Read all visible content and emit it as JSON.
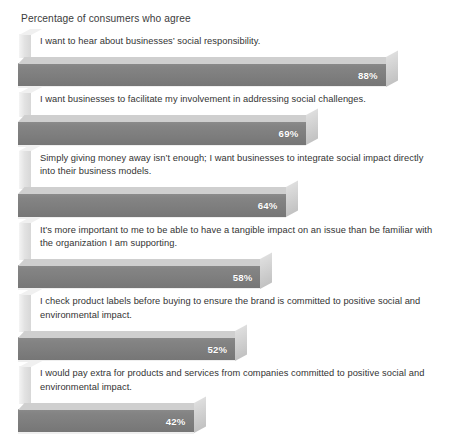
{
  "chart": {
    "title": "Percentage of consumers who agree"
  },
  "chart_data": {
    "type": "bar",
    "orientation": "horizontal",
    "title": "Percentage of consumers who agree",
    "xlabel": "",
    "ylabel": "",
    "xlim": [
      0,
      100
    ],
    "grid": false,
    "legend": null,
    "value_suffix": "%",
    "categories": [
      "I want to hear about businesses’ social responsibility.",
      "I want businesses to facilitate my involvement in addressing social challenges.",
      "Simply giving money away isn’t enough; I want businesses to integrate social impact directly into their business models.",
      "It’s more important to me to be able to have a tangible impact on an issue than be familiar with the organization I am supporting.",
      "I check product labels before buying to ensure the brand is committed to positive social and environmental impact.",
      "I would pay extra for products and services from companies committed to positive social and environmental impact."
    ],
    "values": [
      88,
      69,
      64,
      58,
      52,
      42
    ],
    "value_labels": [
      "88%",
      "69%",
      "64%",
      "58%",
      "52%",
      "42%"
    ],
    "colors": {
      "bar_face": "#808080",
      "bar_top": "#cfcfcf",
      "bar_cap": "#cdcdcd",
      "label_text": "#333333",
      "value_text": "#ffffff",
      "background": "#ffffff"
    }
  },
  "rows": [
    {
      "label": "I want to hear about businesses’ social responsibility.",
      "value": 88,
      "value_label": "88%"
    },
    {
      "label": "I want businesses to facilitate my involvement in addressing social challenges.",
      "value": 69,
      "value_label": "69%"
    },
    {
      "label": "Simply giving money away isn’t enough; I want businesses to integrate social impact directly into their business models.",
      "value": 64,
      "value_label": "64%"
    },
    {
      "label": "It’s more important to me to be able to have a tangible impact on an issue than be familiar with the organization I am supporting.",
      "value": 58,
      "value_label": "58%"
    },
    {
      "label": "I check product labels before buying to ensure the brand is committed to positive social and environmental impact.",
      "value": 52,
      "value_label": "52%"
    },
    {
      "label": "I would pay extra for products and services from companies committed to positive social and environmental impact.",
      "value": 42,
      "value_label": "42%"
    }
  ]
}
